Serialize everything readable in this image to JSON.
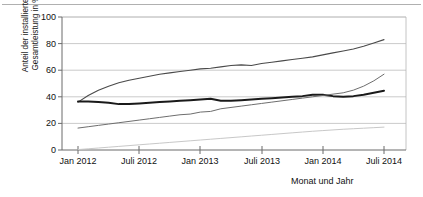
{
  "chart_data": {
    "type": "line",
    "title": "",
    "xlabel": "Monat und Jahr",
    "ylabel_line1": "Anteil der installierten",
    "ylabel_line2": "Gesamtleistung in %",
    "ylim": [
      0,
      100
    ],
    "yticks": [
      0,
      20,
      40,
      60,
      80,
      100
    ],
    "ytick_labels": [
      "0",
      "20",
      "40",
      "60",
      "80",
      "100"
    ],
    "xticks": [
      "Jan 2012",
      "Juli 2012",
      "Jan 2013",
      "Juli 2013",
      "Jan 2014",
      "Juli 2014"
    ],
    "grid": true,
    "legend": "none",
    "x_units": "months from Jan 2012",
    "series": [
      {
        "name": "series-1-upper-thin",
        "color": "#4a4a4a",
        "width": 1.1,
        "x": [
          0,
          1,
          2,
          3,
          4,
          5,
          6,
          7,
          8,
          9,
          10,
          11,
          12,
          13,
          14,
          15,
          16,
          17,
          18,
          19,
          20,
          21,
          22,
          23,
          24,
          25,
          26,
          27,
          28,
          29,
          30
        ],
        "values": [
          36,
          41,
          45,
          48,
          50.5,
          52.5,
          54,
          55.5,
          57,
          58,
          59,
          60,
          61,
          61.5,
          62.5,
          63.5,
          64,
          63.5,
          65,
          66,
          67,
          68,
          69,
          70,
          71.5,
          73,
          74.5,
          76,
          78,
          80.5,
          83
        ]
      },
      {
        "name": "series-2-bold",
        "color": "#1a1a1a",
        "width": 2.0,
        "x": [
          0,
          1,
          2,
          3,
          4,
          5,
          6,
          7,
          8,
          9,
          10,
          11,
          12,
          13,
          14,
          15,
          16,
          17,
          18,
          19,
          20,
          21,
          22,
          23,
          24,
          25,
          26,
          27,
          28,
          29,
          30
        ],
        "values": [
          36.5,
          36.5,
          36,
          35.5,
          34.5,
          34.5,
          35,
          35.5,
          36,
          36.5,
          37,
          37.5,
          38,
          38.5,
          37,
          37,
          37.5,
          38,
          38.5,
          39,
          39.5,
          40,
          40.5,
          41.5,
          41.5,
          40.5,
          40,
          40.5,
          41.5,
          43,
          44.5
        ]
      },
      {
        "name": "series-3-thin-rising",
        "color": "#6e6e6e",
        "width": 1.0,
        "x": [
          0,
          1,
          2,
          3,
          4,
          5,
          6,
          7,
          8,
          9,
          10,
          11,
          12,
          13,
          14,
          15,
          16,
          17,
          18,
          19,
          20,
          21,
          22,
          23,
          24,
          25,
          26,
          27,
          28,
          29,
          30
        ],
        "values": [
          16.5,
          17.5,
          18.5,
          19.5,
          20.5,
          21.5,
          22.5,
          23.5,
          24.5,
          25.5,
          26.5,
          27,
          28.5,
          29,
          31,
          32,
          33,
          34,
          35,
          36,
          37,
          38,
          39,
          40,
          41,
          42,
          43,
          45,
          48,
          52,
          57
        ]
      },
      {
        "name": "series-4-faint-lower",
        "color": "#c8c8c8",
        "width": 1.0,
        "x": [
          0,
          1,
          2,
          3,
          4,
          5,
          6,
          7,
          8,
          9,
          10,
          11,
          12,
          13,
          14,
          15,
          16,
          17,
          18,
          19,
          20,
          21,
          22,
          23,
          24,
          25,
          26,
          27,
          28,
          29,
          30
        ],
        "values": [
          0.3,
          0.9,
          1.5,
          2.1,
          2.7,
          3.3,
          3.9,
          4.5,
          5.1,
          5.7,
          6.3,
          6.9,
          7.5,
          8.1,
          8.7,
          9.3,
          9.9,
          10.5,
          11.1,
          11.7,
          12.3,
          12.9,
          13.5,
          14.1,
          14.6,
          15.1,
          15.6,
          16.0,
          16.4,
          16.8,
          17.2
        ]
      }
    ]
  }
}
